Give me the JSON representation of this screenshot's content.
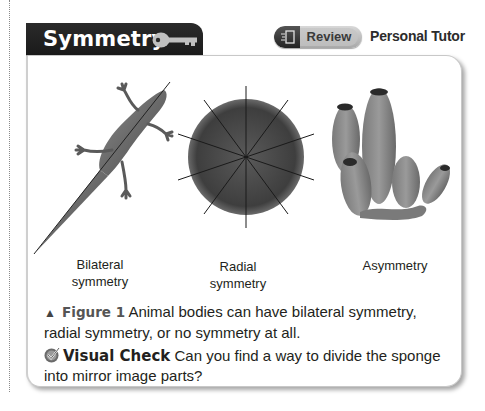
{
  "section": {
    "title": "Symmetry",
    "title_icon": "key-icon"
  },
  "toolbar": {
    "review_icon": "review-document-icon",
    "review_label": "Review",
    "personal_tutor_label": "Personal Tutor"
  },
  "figure": {
    "panels": [
      {
        "image": "lizard-bilateral-symmetry",
        "label_line1": "Bilateral",
        "label_line2": "symmetry"
      },
      {
        "image": "sand-dollar-radial-symmetry",
        "label_line1": "Radial",
        "label_line2": "symmetry"
      },
      {
        "image": "sponge-asymmetry",
        "label_line1": "Asymmetry",
        "label_line2": ""
      }
    ],
    "caption_marker": "▲",
    "caption_tag": "Figure 1",
    "caption_text": "Animal bodies can have bilateral symmetry, radial symmetry, or no symmetry at all."
  },
  "visual_check": {
    "icon": "check-mark-icon",
    "label": "Visual Check",
    "question": "Can you find a way to divide the sponge into mirror image parts?"
  },
  "colors": {
    "tab_bg": "#1f1f1f",
    "tab_text": "#ffffff",
    "panel_border": "#c8c8c8",
    "body_text": "#231f20"
  }
}
